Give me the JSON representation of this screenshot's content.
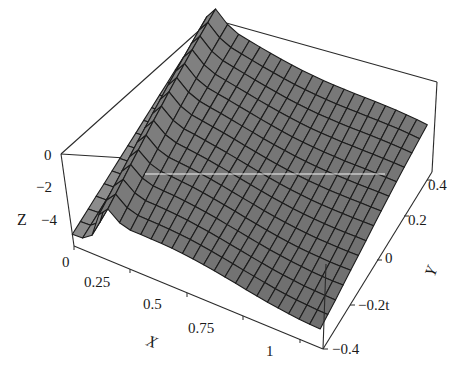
{
  "chart_data": {
    "type": "surface3d",
    "title": "",
    "xlabel": "X",
    "ylabel": "Y",
    "zlabel": "Z",
    "x_ticks": [
      "0",
      "0.25",
      "0.5",
      "0.75",
      "1"
    ],
    "y_ticks": [
      "-0.4",
      "-0.2t",
      "0",
      "0.2",
      "0.4"
    ],
    "z_ticks": [
      "0",
      "-2",
      "-4"
    ],
    "xlim": [
      0,
      1.1
    ],
    "ylim": [
      -0.45,
      0.45
    ],
    "zlim": [
      -5.5,
      0
    ],
    "grid": false,
    "boxed": true,
    "mesh_lines": {
      "x": 24,
      "y": 14
    },
    "sample_surface": {
      "x": [
        0,
        0.05,
        0.1,
        0.15,
        0.2,
        0.3,
        0.4,
        0.5,
        0.6,
        0.7,
        0.8,
        0.9,
        1.0,
        1.1
      ],
      "y": [
        -0.4,
        -0.2,
        0,
        0.2,
        0.4
      ],
      "z_rows": [
        [
          -5,
          -4.8,
          -3.0,
          -1.4,
          -1.8,
          -2.4,
          -2.7,
          -2.9,
          -3.0,
          -3.1,
          -3.2,
          -3.3,
          -3.4,
          -3.5
        ],
        [
          -5,
          -4.8,
          -2.8,
          -1.2,
          -1.6,
          -2.1,
          -2.4,
          -2.6,
          -2.7,
          -2.8,
          -2.9,
          -3.0,
          -3.1,
          -3.2
        ],
        [
          -5,
          -4.8,
          -2.6,
          -1.0,
          -1.3,
          -1.8,
          -2.0,
          -2.2,
          -2.3,
          -2.4,
          -2.5,
          -2.6,
          -2.7,
          -2.8
        ],
        [
          -5,
          -4.8,
          -2.4,
          -0.8,
          -1.0,
          -1.4,
          -1.6,
          -1.8,
          -1.9,
          -2.0,
          -2.1,
          -2.2,
          -2.3,
          -2.4
        ],
        [
          -5,
          -4.8,
          -2.2,
          -0.6,
          -0.8,
          -1.1,
          -1.3,
          -1.4,
          -1.5,
          -1.6,
          -1.7,
          -1.8,
          -1.9,
          -2.0
        ]
      ]
    },
    "colors": {
      "surface": "#7a7a7a",
      "mesh": "#1c1c1c",
      "box": "#2a2a2a",
      "background": "#ffffff"
    }
  },
  "labels": {
    "z_axis": "Z",
    "x_axis": "X",
    "y_axis": "Y",
    "z_tick_0": "0",
    "z_tick_m2": "−2",
    "z_tick_m4": "−4",
    "x_tick_0": "0",
    "x_tick_025": "0.25",
    "x_tick_05": "0.5",
    "x_tick_075": "0.75",
    "x_tick_1": "1",
    "y_tick_m04": "−0.4",
    "y_tick_m02": "−0.2t",
    "y_tick_0": "0",
    "y_tick_02": "0.2",
    "y_tick_04": "0.4"
  }
}
